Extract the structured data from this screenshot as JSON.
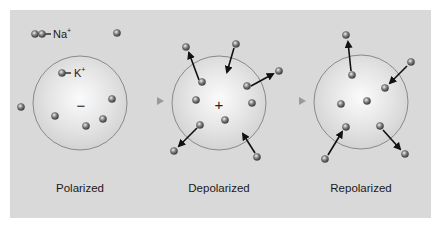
{
  "legend": {
    "sodium": {
      "symbol": "Na",
      "charge": "+"
    },
    "potassium": {
      "symbol": "K",
      "charge": "+"
    }
  },
  "colors": {
    "background": "#d9d9d9",
    "cell_border": "#8a8a8a",
    "ion": "#6e6e6e",
    "arrow": "#111111",
    "transition_arrow": "#b8b8b8"
  },
  "stages": [
    {
      "label": "Polarized",
      "charge": "−",
      "center": [
        80,
        103
      ],
      "ions": [
        [
          35,
          34
        ],
        [
          117,
          33
        ],
        [
          21,
          107
        ],
        [
          112,
          99
        ],
        [
          103,
          119
        ],
        [
          55,
          116
        ],
        [
          86,
          126
        ]
      ],
      "arrows": []
    },
    {
      "label": "Depolarized",
      "charge": "+",
      "center": [
        219,
        103
      ],
      "ions": [
        [
          186,
          47
        ],
        [
          236,
          44
        ],
        [
          279,
          71
        ],
        [
          202,
          82
        ],
        [
          247,
          86
        ],
        [
          196,
          100
        ],
        [
          252,
          103
        ],
        [
          225,
          120
        ],
        [
          200,
          125
        ],
        [
          174,
          151
        ],
        [
          257,
          157
        ]
      ],
      "arrows": [
        {
          "from": [
            199,
            80
          ],
          "to": [
            189,
            53
          ]
        },
        {
          "from": [
            234,
            48
          ],
          "to": [
            227,
            72
          ]
        },
        {
          "from": [
            251,
            86
          ],
          "to": [
            273,
            74
          ]
        },
        {
          "from": [
            197,
            128
          ],
          "to": [
            179,
            146
          ]
        },
        {
          "from": [
            255,
            153
          ],
          "to": [
            243,
            134
          ]
        }
      ]
    },
    {
      "label": "Repolarized",
      "charge": "",
      "center": [
        361,
        102
      ],
      "ions": [
        [
          346,
          35
        ],
        [
          411,
          62
        ],
        [
          352,
          75
        ],
        [
          385,
          88
        ],
        [
          341,
          104
        ],
        [
          367,
          101
        ],
        [
          346,
          127
        ],
        [
          380,
          126
        ],
        [
          325,
          159
        ],
        [
          405,
          154
        ]
      ],
      "arrows": [
        {
          "from": [
            351,
            71
          ],
          "to": [
            348,
            42
          ]
        },
        {
          "from": [
            407,
            66
          ],
          "to": [
            390,
            83
          ]
        },
        {
          "from": [
            328,
            155
          ],
          "to": [
            342,
            132
          ]
        },
        {
          "from": [
            383,
            130
          ],
          "to": [
            400,
            149
          ]
        }
      ]
    }
  ],
  "transitions": [
    {
      "from": [
        135,
        101
      ],
      "to": [
        164,
        101
      ]
    },
    {
      "from": [
        276,
        101
      ],
      "to": [
        306,
        101
      ]
    }
  ],
  "labels_y": 188
}
